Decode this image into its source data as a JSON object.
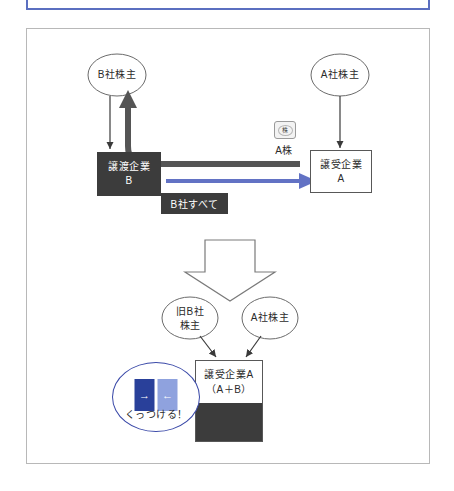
{
  "top_panel": {
    "name": "blue-outlined-panel",
    "border_color": "#5b6fc0",
    "content": ""
  },
  "diagram": {
    "title": "",
    "frame_border_color": "#b8b8b8",
    "colors": {
      "dark_box": "#3c3c3c",
      "blue_arrow": "#6272c4",
      "thick_arrow": "#555555",
      "bubble_border": "#3a49a8",
      "chip_left": "#29409a",
      "chip_right": "#8fa2de",
      "outline": "#585858"
    },
    "upper": {
      "shareholder_b": "B社株主",
      "shareholder_a": "A社株主",
      "company_b_line1": "譲渡企業",
      "company_b_line2": "B",
      "company_a_line1": "譲受企業",
      "company_a_line2": "A",
      "stock_icon_glyph": "株",
      "stock_caption": "A株",
      "transfer_tag": "B社すべて"
    },
    "lower": {
      "shareholder_old_b_line1": "旧B社",
      "shareholder_old_b_line2": "株主",
      "shareholder_a": "A社株主",
      "merged_company_line1": "譲受企業A",
      "merged_company_line2": "（A＋B）"
    },
    "bubble": {
      "text": "くっつける！",
      "left_chip_arrow": "→",
      "right_chip_arrow": "←"
    }
  }
}
